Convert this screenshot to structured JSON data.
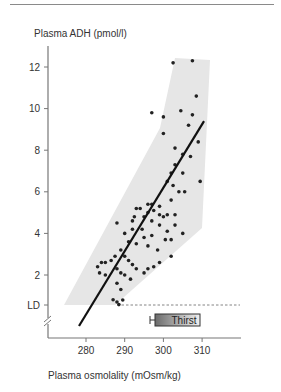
{
  "chart_data": {
    "type": "scatter",
    "title": "",
    "ylabel": "Plasma ADH (pmol/l)",
    "xlabel": "Plasma osmolality (mOsm/kg)",
    "x_ticks": [
      "280",
      "290",
      "300",
      "310"
    ],
    "y_ticks": [
      "LD",
      "2",
      "4",
      "6",
      "8",
      "10",
      "12"
    ],
    "xlim": [
      271,
      319
    ],
    "ylim": [
      -0.5,
      12.8
    ],
    "grid": false,
    "legend": "none",
    "annotations": [
      {
        "type": "regression_line",
        "from": [
          278.5,
          -1.3
        ],
        "to": [
          310.5,
          9.4
        ]
      },
      {
        "type": "shaded_band",
        "label": "normal range"
      },
      {
        "type": "dashed_line",
        "label": "limit of detection",
        "y": "LD",
        "x_from": 289,
        "x_to": 319
      },
      {
        "type": "bar",
        "label": "Thirst",
        "x_from": 298,
        "x_to": 310,
        "error_left": 296.5
      }
    ],
    "points": [
      [
        302.5,
        12.2
      ],
      [
        307.5,
        12.3
      ],
      [
        308.5,
        10.6
      ],
      [
        297,
        9.8
      ],
      [
        304.5,
        9.9
      ],
      [
        307.5,
        9.7
      ],
      [
        300,
        9.6
      ],
      [
        306.5,
        9.2
      ],
      [
        300,
        8.8
      ],
      [
        309,
        8.4
      ],
      [
        303,
        8.1
      ],
      [
        305,
        7.8
      ],
      [
        307,
        7.7
      ],
      [
        303,
        7.3
      ],
      [
        302,
        6.9
      ],
      [
        305,
        6.9
      ],
      [
        301,
        6.5
      ],
      [
        302.5,
        6.3
      ],
      [
        309.5,
        6.5
      ],
      [
        304,
        6.0
      ],
      [
        305.5,
        6.0
      ],
      [
        302,
        5.6
      ],
      [
        299,
        5.3
      ],
      [
        296,
        5.4
      ],
      [
        297,
        5.4
      ],
      [
        294,
        5.2
      ],
      [
        293,
        5.2
      ],
      [
        296,
        5.0
      ],
      [
        297.5,
        5.1
      ],
      [
        292,
        4.6
      ],
      [
        299,
        4.9
      ],
      [
        300,
        4.8
      ],
      [
        301,
        4.9
      ],
      [
        303,
        4.9
      ],
      [
        288,
        4.5
      ],
      [
        292.5,
        4.8
      ],
      [
        295,
        4.8
      ],
      [
        297,
        4.6
      ],
      [
        299,
        4.4
      ],
      [
        301,
        4.1
      ],
      [
        303,
        4.4
      ],
      [
        305,
        4.0
      ],
      [
        294.5,
        4.2
      ],
      [
        292,
        4.2
      ],
      [
        290,
        4.0
      ],
      [
        295,
        3.8
      ],
      [
        297,
        3.9
      ],
      [
        300.5,
        3.7
      ],
      [
        302,
        3.7
      ],
      [
        291,
        3.6
      ],
      [
        293,
        3.5
      ],
      [
        296,
        3.4
      ],
      [
        298.5,
        3.2
      ],
      [
        302,
        2.9
      ],
      [
        299,
        2.6
      ],
      [
        289,
        3.2
      ],
      [
        290,
        2.9
      ],
      [
        291,
        2.7
      ],
      [
        292,
        2.5
      ],
      [
        293,
        2.3
      ],
      [
        295,
        2.1
      ],
      [
        296,
        2.3
      ],
      [
        297.5,
        2.4
      ],
      [
        283,
        2.4
      ],
      [
        284,
        2.6
      ],
      [
        285,
        2.6
      ],
      [
        286.5,
        2.7
      ],
      [
        287.5,
        2.9
      ],
      [
        283.5,
        2.1
      ],
      [
        285,
        2.0
      ],
      [
        288,
        2.3
      ],
      [
        289,
        2.1
      ],
      [
        290,
        2.0
      ],
      [
        291.5,
        1.8
      ],
      [
        288,
        1.6
      ],
      [
        289,
        1.3
      ],
      [
        288,
        0.7
      ],
      [
        287,
        0.4
      ],
      [
        289.5,
        0.8
      ],
      [
        288.5,
        -0.2
      ]
    ]
  }
}
